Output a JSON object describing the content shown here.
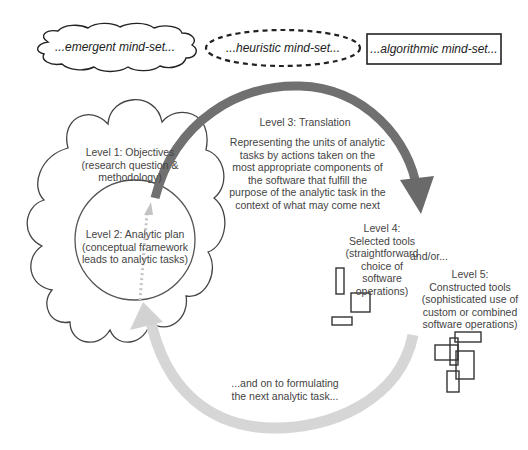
{
  "mindsets": {
    "emergent": "...emergent mind-set...",
    "heuristic": "...heuristic mind-set...",
    "algorithmic": "...algorithmic mind-set..."
  },
  "levels": {
    "level1": {
      "title": "Level 1: Objectives",
      "desc_line1": "(research question &",
      "desc_line2": "methodology)"
    },
    "level2": {
      "title": "Level 2: Analytic plan",
      "desc_line1": "(conceptual framework",
      "desc_line2": "leads to analytic tasks)"
    },
    "level3": {
      "title": "Level 3: Translation",
      "desc": [
        "Representing the units of analytic",
        "tasks by actions taken on the",
        "most appropriate components of",
        "the software that fulfill the",
        "purpose of the analytic task in the",
        "context of what may come next"
      ]
    },
    "level4": {
      "lines": [
        "Level 4:",
        "Selected tools",
        "(straightforward",
        "choice of",
        "software",
        "operations)"
      ]
    },
    "andor": "and/or...",
    "level5": {
      "lines": [
        "Level 5:",
        "Constructed tools",
        "(sophisticated use of",
        "custom or combined",
        "software operations)"
      ]
    }
  },
  "loop_back_text": {
    "line1": "...and on to formulating",
    "line2": "the next analytic task..."
  },
  "colors": {
    "dark_arrow": "#6e6e6e",
    "light_arrow": "#d4d4d4",
    "dotted_arrow": "#c8c8c8",
    "outline": "#555555",
    "box_outline": "#333333"
  }
}
